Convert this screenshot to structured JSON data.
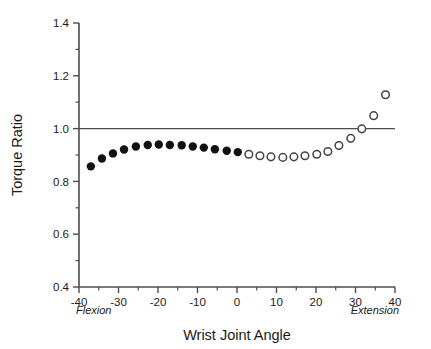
{
  "chart_data": {
    "type": "scatter",
    "title": "",
    "xlabel": "Wrist Joint Angle",
    "ylabel": "Torque Ratio",
    "xlim": [
      -40,
      40
    ],
    "ylim": [
      0.4,
      1.4
    ],
    "xticks": [
      -40,
      -30,
      -20,
      -10,
      0,
      10,
      20,
      30,
      40
    ],
    "xtick_labels": [
      "-40",
      "-30",
      "-20",
      "-10",
      "0",
      "10",
      "20",
      "30",
      "40"
    ],
    "yticks": [
      0.4,
      0.6,
      0.8,
      1.0,
      1.2,
      1.4
    ],
    "ytick_labels": [
      "0.4",
      "0.6",
      "0.8",
      "1.0",
      "1.2",
      "1.4"
    ],
    "x_minor_ticks": [
      -35,
      -25,
      -15,
      -5,
      5,
      15,
      25,
      35
    ],
    "y_minor_ticks": [
      0.5,
      0.7,
      0.9,
      1.1,
      1.3
    ],
    "grid": false,
    "legend": "none",
    "reference_line": {
      "axis": "y",
      "value": 1.0,
      "color": "#4d4d4d"
    },
    "annotations": [
      {
        "text": "Flexion",
        "position": "bottom-left",
        "style": "italic"
      },
      {
        "text": "Extension",
        "position": "bottom-right",
        "style": "italic"
      }
    ],
    "series": [
      {
        "name": "Flexion range",
        "marker": "filled-circle",
        "color": "#111111",
        "points": [
          {
            "x": -37.0,
            "y": 0.857
          },
          {
            "x": -34.2,
            "y": 0.887
          },
          {
            "x": -31.4,
            "y": 0.906
          },
          {
            "x": -28.6,
            "y": 0.921
          },
          {
            "x": -25.6,
            "y": 0.932
          },
          {
            "x": -22.6,
            "y": 0.938
          },
          {
            "x": -19.8,
            "y": 0.94
          },
          {
            "x": -17.0,
            "y": 0.938
          },
          {
            "x": -14.0,
            "y": 0.937
          },
          {
            "x": -11.2,
            "y": 0.932
          },
          {
            "x": -8.4,
            "y": 0.928
          },
          {
            "x": -5.6,
            "y": 0.922
          },
          {
            "x": -2.6,
            "y": 0.916
          },
          {
            "x": 0.2,
            "y": 0.911
          }
        ]
      },
      {
        "name": "Extension range",
        "marker": "open-circle",
        "color": "#444444",
        "points": [
          {
            "x": 3.0,
            "y": 0.903
          },
          {
            "x": 5.8,
            "y": 0.897
          },
          {
            "x": 8.6,
            "y": 0.893
          },
          {
            "x": 11.6,
            "y": 0.891
          },
          {
            "x": 14.4,
            "y": 0.893
          },
          {
            "x": 17.2,
            "y": 0.897
          },
          {
            "x": 20.2,
            "y": 0.903
          },
          {
            "x": 23.0,
            "y": 0.913
          },
          {
            "x": 25.8,
            "y": 0.936
          },
          {
            "x": 28.8,
            "y": 0.963
          },
          {
            "x": 31.6,
            "y": 0.999
          },
          {
            "x": 34.6,
            "y": 1.049
          },
          {
            "x": 37.6,
            "y": 1.128
          }
        ]
      }
    ]
  }
}
